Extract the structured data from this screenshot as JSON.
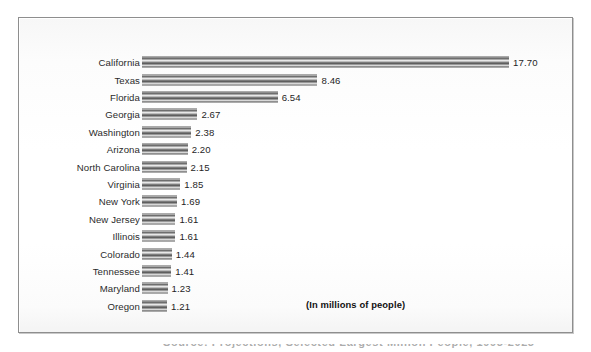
{
  "figure": {
    "units_note": "(In millions of people)",
    "caption_partial": "Source: Projections, Selected Largest Million People, 1995-2025"
  },
  "chart_data": {
    "type": "bar",
    "orientation": "horizontal",
    "title": "",
    "subtitle": "",
    "xlabel": "",
    "ylabel": "",
    "units": "millions of people",
    "annotations": [
      "(In millions of people)"
    ],
    "grid": false,
    "legend": false,
    "xlim": [
      0,
      17.7
    ],
    "axis_visible": false,
    "categories": [
      "California",
      "Texas",
      "Florida",
      "Georgia",
      "Washington",
      "Arizona",
      "North Carolina",
      "Virginia",
      "New York",
      "New Jersey",
      "Illinois",
      "Colorado",
      "Tennessee",
      "Maryland",
      "Oregon"
    ],
    "values": [
      17.7,
      8.46,
      6.54,
      2.67,
      2.38,
      2.2,
      2.15,
      1.85,
      1.69,
      1.61,
      1.61,
      1.44,
      1.41,
      1.23,
      1.21
    ],
    "value_labels": [
      "17.70",
      "8.46",
      "6.54",
      "2.67",
      "2.38",
      "2.20",
      "2.15",
      "1.85",
      "1.69",
      "1.61",
      "1.61",
      "1.44",
      "1.41",
      "1.23",
      "1.21"
    ],
    "colors": {
      "bar_fill": "#8f8f8f",
      "bar_edge": "#585858",
      "text": "#1f1f1f",
      "frame": "#8e8e8e",
      "background": "#ffffff"
    }
  }
}
